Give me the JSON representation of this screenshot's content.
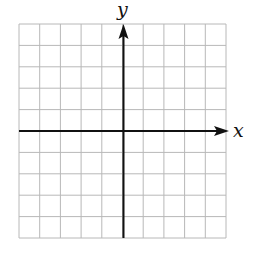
{
  "chart_data": {
    "type": "coordinate-grid",
    "title": "",
    "xlabel": "x",
    "ylabel": "y",
    "grid": {
      "columns": 10,
      "rows": 10,
      "on": true
    },
    "xlim": [
      -5,
      5
    ],
    "ylim": [
      -5,
      5
    ],
    "x_axis_arrow": "positive",
    "y_axis_arrow": "positive",
    "tick_labels": [],
    "series": []
  },
  "labels": {
    "x": "x",
    "y": "y"
  },
  "colors": {
    "grid": "#b8b8b8",
    "axis": "#111111",
    "background": "#ffffff"
  }
}
